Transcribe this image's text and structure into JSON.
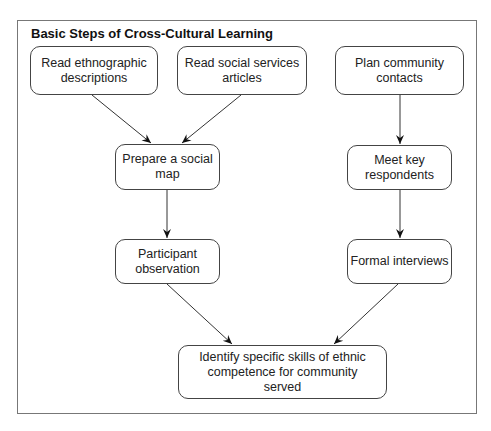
{
  "diagram": {
    "title": "Basic Steps of Cross-Cultural Learning",
    "nodes": [
      {
        "id": "read-ethnographic",
        "label": "Read ethnographic descriptions"
      },
      {
        "id": "read-social-services",
        "label": "Read social services articles"
      },
      {
        "id": "plan-community",
        "label": "Plan community contacts"
      },
      {
        "id": "prepare-social-map",
        "label": "Prepare a social map"
      },
      {
        "id": "meet-key-respondents",
        "label": "Meet key respondents"
      },
      {
        "id": "participant-observation",
        "label": "Participant observation"
      },
      {
        "id": "formal-interviews",
        "label": "Formal interviews"
      },
      {
        "id": "identify-skills",
        "label": "Identify specific skills of ethnic competence for community served"
      }
    ],
    "edges": [
      {
        "from": "read-ethnographic",
        "to": "prepare-social-map"
      },
      {
        "from": "read-social-services",
        "to": "prepare-social-map"
      },
      {
        "from": "plan-community",
        "to": "meet-key-respondents"
      },
      {
        "from": "prepare-social-map",
        "to": "participant-observation"
      },
      {
        "from": "meet-key-respondents",
        "to": "formal-interviews"
      },
      {
        "from": "participant-observation",
        "to": "identify-skills"
      },
      {
        "from": "formal-interviews",
        "to": "identify-skills"
      }
    ]
  }
}
